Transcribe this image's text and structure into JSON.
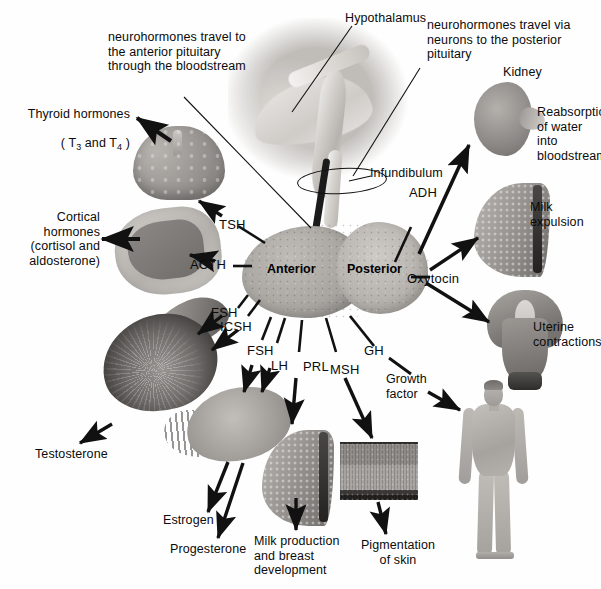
{
  "diagram": {
    "type": "anatomical-flow-diagram",
    "background_color": "#fefefe",
    "text_color": "#0b0b0b",
    "arrow_color": "#111111"
  },
  "annotations": {
    "anterior_route": "neurohormones travel to\nthe anterior pituitary\nthrough the bloodstream",
    "posterior_route": "neurohormones travel via\nneurons to the posterior\npituitary",
    "hypothalamus": "Hypothalamus",
    "infundibulum": "Infundibulum"
  },
  "pituitary": {
    "anterior_label": "Anterior",
    "posterior_label": "Posterior"
  },
  "hormones": {
    "tsh": "TSH",
    "acth": "ACTH",
    "fsh_male": "FSH",
    "icsh": "ICSH",
    "fsh_female": "FSH",
    "lh": "LH",
    "prl": "PRL",
    "msh": "MSH",
    "gh": "GH",
    "growth_factor": "Growth\nfactor",
    "adh": "ADH",
    "oxytocin": "Oxytocin"
  },
  "targets": {
    "thyroid_hormones_line1": "Thyroid hormones",
    "thyroid_hormones_line2_pre": "( T",
    "thyroid_hormones_sub1": "3",
    "thyroid_hormones_mid": " and T",
    "thyroid_hormones_sub2": "4",
    "thyroid_hormones_end": " )",
    "cortical_hormones": "Cortical\nhormones\n(cortisol and\naldosterone)",
    "testosterone": "Testosterone",
    "estrogen": "Estrogen",
    "progesterone": "Progesterone",
    "milk_production": "Milk production\nand breast\ndevelopment",
    "pigmentation": "Pigmentation\nof skin",
    "kidney": "Kidney",
    "reabsorption": "Reabsorption\nof water into\nbloodstream",
    "milk_expulsion": "Milk\nexpulsion",
    "uterine_contractions": "Uterine\ncontractions"
  },
  "organs": [
    {
      "name": "thyroid-gland"
    },
    {
      "name": "adrenal-gland"
    },
    {
      "name": "testis"
    },
    {
      "name": "ovary"
    },
    {
      "name": "breast-prolactin"
    },
    {
      "name": "skin-section"
    },
    {
      "name": "human-figure"
    },
    {
      "name": "kidney"
    },
    {
      "name": "breast-oxytocin"
    },
    {
      "name": "uterus"
    },
    {
      "name": "brain-hypothalamus"
    },
    {
      "name": "pituitary-gland"
    }
  ]
}
